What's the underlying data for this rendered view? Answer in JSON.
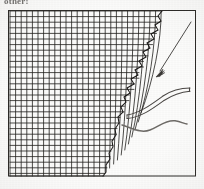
{
  "figure": {
    "caption_fragment": "other:",
    "frame": {
      "x": 8,
      "y": 10,
      "width": 188,
      "height": 166,
      "stroke": "#2b2926",
      "stroke_width": 1
    },
    "background_color": "#fdfdfc",
    "ink_color": "#1d1b1a",
    "mid_ink_color": "#6d6a66"
  },
  "mesh": {
    "label": "structured-computational-grid",
    "description": "Body-fitted structured quadrilateral mesh occupying the left portion of the frame, clustered and terminating at a jagged body-conforming boundary on the right.",
    "n_columns": 30,
    "n_rows": 28,
    "cell_width_px": 5.6,
    "cell_height_px": 5.6,
    "x_start": 9,
    "y_start": 11,
    "line_color": "#201e1c",
    "line_width": 0.85,
    "boundary_style": "jagged-staircase",
    "boundary_points": [
      [
        162,
        11
      ],
      [
        158,
        16
      ],
      [
        161,
        21
      ],
      [
        155,
        25
      ],
      [
        158,
        30
      ],
      [
        151,
        34
      ],
      [
        154,
        39
      ],
      [
        147,
        43
      ],
      [
        150,
        48
      ],
      [
        143,
        52
      ],
      [
        146,
        57
      ],
      [
        139,
        61
      ],
      [
        142,
        66
      ],
      [
        135,
        70
      ],
      [
        138,
        75
      ],
      [
        131,
        79
      ],
      [
        134,
        84
      ],
      [
        127,
        88
      ],
      [
        130,
        93
      ],
      [
        124,
        97
      ],
      [
        126,
        102
      ],
      [
        121,
        107
      ],
      [
        123,
        112
      ],
      [
        118,
        117
      ],
      [
        119,
        123
      ],
      [
        115,
        129
      ],
      [
        116,
        135
      ],
      [
        112,
        141
      ],
      [
        113,
        147
      ],
      [
        109,
        153
      ],
      [
        110,
        159
      ],
      [
        106,
        165
      ],
      [
        106,
        172
      ],
      [
        103,
        176
      ]
    ]
  },
  "annotations": [
    {
      "id": "arrow",
      "name": "annotation-arrow",
      "description": "Slender leader arrow pointing down-left toward the mesh boundary",
      "from": [
        191,
        22
      ],
      "to": [
        157,
        76
      ],
      "color": "#3a3835",
      "head_length": 13,
      "head_width": 4
    },
    {
      "id": "airfoil",
      "name": "airfoil-body-outline",
      "description": "Thin double-line slender body (airfoil/wing section) extending from the mesh boundary to the right frame edge",
      "color": "#4a4744",
      "stroke_width": 1.1,
      "upper_path": "M 127,115 C 140,113 152,104 163,96 C 172,90 181,88 190,88",
      "lower_path": "M 127,118 C 141,117 153,108 164,100 C 173,94 181,92 190,91",
      "tip": [
        190,
        89
      ]
    },
    {
      "id": "wake",
      "name": "wake-wavy-line",
      "description": "Wavy trailing line (wake / shear layer) below the body",
      "color": "#6f6c68",
      "stroke_width": 1.6,
      "path": "M 122,125 C 133,128 141,133 150,130 C 159,127 166,120 175,121 C 181,122 184,124 187,124"
    }
  ]
}
